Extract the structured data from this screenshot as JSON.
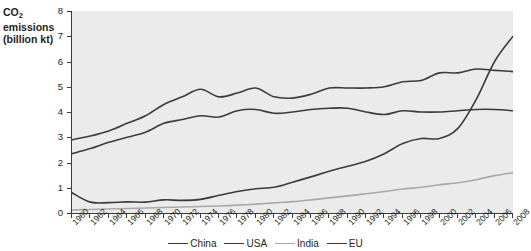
{
  "chart_data": {
    "type": "line",
    "title": "",
    "ylabel_line1": "CO",
    "ylabel_sub": "2",
    "ylabel_line1b": " emissions",
    "ylabel_line2": "(billion kt)",
    "xlabel": "",
    "ylim": [
      0,
      8
    ],
    "xlim": [
      1960,
      2008
    ],
    "yticks": [
      0,
      1,
      2,
      3,
      4,
      5,
      6,
      7,
      8
    ],
    "ytick_labels": [
      "0",
      "1",
      "2",
      "3",
      "4",
      "5",
      "6",
      "7",
      "8"
    ],
    "grid": false,
    "legend_position": "bottom",
    "categories": [
      "1960",
      "1962",
      "1964",
      "1966",
      "1968",
      "1970",
      "1972",
      "1974",
      "1976",
      "1978",
      "1980",
      "1982",
      "1984",
      "1986",
      "1988",
      "1990",
      "1992",
      "1994",
      "1996",
      "1998",
      "2000",
      "2002",
      "2004",
      "2006",
      "2008"
    ],
    "x": [
      1960,
      1962,
      1964,
      1966,
      1968,
      1970,
      1972,
      1974,
      1976,
      1978,
      1980,
      1982,
      1984,
      1986,
      1988,
      1990,
      1992,
      1994,
      1996,
      1998,
      2000,
      2002,
      2004,
      2006,
      2008
    ],
    "series": [
      {
        "name": "China",
        "color": "#3b3b3b",
        "values": [
          0.8,
          0.43,
          0.41,
          0.44,
          0.43,
          0.52,
          0.5,
          0.54,
          0.7,
          0.85,
          0.96,
          1.02,
          1.22,
          1.43,
          1.65,
          1.85,
          2.05,
          2.35,
          2.75,
          2.95,
          2.95,
          3.35,
          4.5,
          6.0,
          7.0
        ]
      },
      {
        "name": "USA",
        "color": "#3b3b3b",
        "values": [
          2.9,
          3.05,
          3.25,
          3.55,
          3.85,
          4.3,
          4.6,
          4.9,
          4.6,
          4.75,
          4.95,
          4.6,
          4.55,
          4.7,
          4.95,
          4.95,
          4.95,
          5.0,
          5.2,
          5.25,
          5.55,
          5.55,
          5.7,
          5.65,
          5.6
        ]
      },
      {
        "name": "India",
        "color": "#a8a8a8",
        "values": [
          0.12,
          0.14,
          0.16,
          0.18,
          0.2,
          0.22,
          0.24,
          0.26,
          0.28,
          0.31,
          0.35,
          0.4,
          0.45,
          0.52,
          0.6,
          0.68,
          0.76,
          0.85,
          0.95,
          1.02,
          1.12,
          1.2,
          1.32,
          1.48,
          1.6
        ]
      },
      {
        "name": "EU",
        "color": "#3b3b3b",
        "values": [
          2.35,
          2.55,
          2.8,
          3.0,
          3.2,
          3.55,
          3.7,
          3.85,
          3.8,
          4.05,
          4.1,
          3.95,
          4.0,
          4.1,
          4.15,
          4.15,
          4.0,
          3.9,
          4.05,
          4.0,
          4.0,
          4.05,
          4.1,
          4.1,
          4.05
        ]
      }
    ],
    "legend": [
      {
        "label": "China",
        "color": "#3b3b3b"
      },
      {
        "label": "USA",
        "color": "#3b3b3b"
      },
      {
        "label": "India",
        "color": "#a8a8a8"
      },
      {
        "label": "EU",
        "color": "#3b3b3b"
      }
    ]
  }
}
